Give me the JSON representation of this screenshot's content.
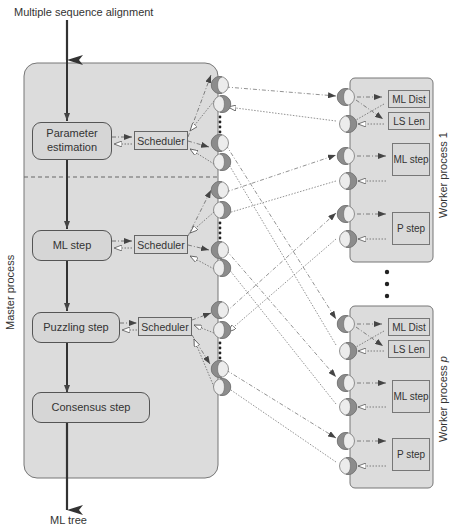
{
  "diagram": {
    "input_label": "Multiple sequence alignment",
    "output_label": "ML tree",
    "master": {
      "label": "Master process",
      "steps": [
        {
          "id": "param",
          "label_line1": "Parameter",
          "label_line2": "estimation"
        },
        {
          "id": "mlstep",
          "label": "ML step"
        },
        {
          "id": "puzzling",
          "label": "Puzzling step"
        },
        {
          "id": "consensus",
          "label": "Consensus step"
        }
      ],
      "schedulers": [
        {
          "label": "Scheduler"
        },
        {
          "label": "Scheduler"
        },
        {
          "label": "Scheduler"
        }
      ]
    },
    "workers": [
      {
        "label": "Worker process 1",
        "tasks": [
          {
            "label": "ML Dist"
          },
          {
            "label": "LS Len"
          },
          {
            "label": "ML step"
          },
          {
            "label": "P step"
          }
        ]
      },
      {
        "label_prefix": "Worker process ",
        "label_var": "p",
        "tasks": [
          {
            "label": "ML Dist"
          },
          {
            "label": "LS Len"
          },
          {
            "label": "ML step"
          },
          {
            "label": "P step"
          }
        ]
      }
    ],
    "colors": {
      "process_fill": "#dcdcdc",
      "port_dark": "#8c8c8c",
      "port_light": "#ececec",
      "line": "#555555"
    }
  }
}
